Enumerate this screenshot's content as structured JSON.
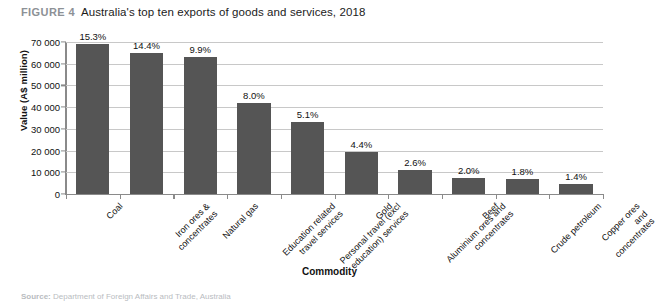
{
  "figure": {
    "tag": "FIGURE 4",
    "title": "Australia's top ten exports of goods and services, 2018"
  },
  "source": {
    "label": "Source:",
    "text": "Department of Foreign Affairs and Trade, Australia"
  },
  "colors": {
    "bar": "#555555",
    "gridline": "#c8c8c8",
    "axis": "#8a8a8a",
    "figure_tag": "#8d9196",
    "text": "#111111"
  },
  "chart_data": {
    "type": "bar",
    "title": "Australia's top ten exports of goods and services, 2018",
    "xlabel": "Commodity",
    "ylabel": "Value (A$ million)",
    "ylim": [
      0,
      70000
    ],
    "yticks": [
      0,
      10000,
      20000,
      30000,
      40000,
      50000,
      60000,
      70000
    ],
    "ytick_labels": [
      "0",
      "10 000",
      "20 000",
      "30 000",
      "40 000",
      "50 000",
      "60 000",
      "70 000"
    ],
    "grid": true,
    "legend": null,
    "categories": [
      "Coal",
      "Iron ores &\nconcentrates",
      "Natural gas",
      "Education related\ntravel services",
      "Personal travel (excl\neducation) services",
      "Gold",
      "Aluminium ores and\nconcentrates",
      "Beef",
      "Crude petroleum",
      "Copper ores and\nconcentrates"
    ],
    "values": [
      69000,
      65000,
      63000,
      42000,
      33000,
      19500,
      11000,
      7500,
      7000,
      4500
    ],
    "data_labels": [
      "15.3%",
      "14.4%",
      "9.9%",
      "8.0%",
      "5.1%",
      "4.4%",
      "2.6%",
      "2.0%",
      "1.8%",
      "1.4%"
    ]
  }
}
